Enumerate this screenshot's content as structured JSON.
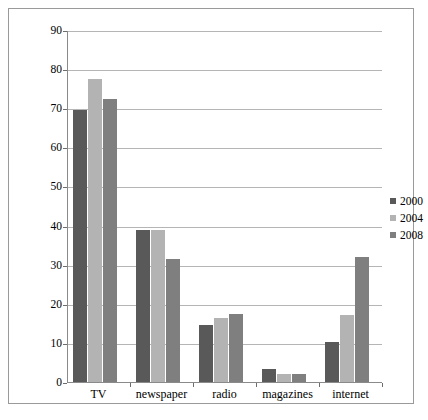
{
  "chart_data": {
    "type": "bar",
    "title": "",
    "subtitle": "",
    "xlabel": "",
    "ylabel": "% getting most of their news from…",
    "categories": [
      "TV",
      "newspaper",
      "radio",
      "magazines",
      "internet"
    ],
    "series": [
      {
        "name": "2000",
        "color": "#595959",
        "values": [
          69.7,
          39.0,
          14.8,
          3.5,
          10.5
        ]
      },
      {
        "name": "2004",
        "color": "#b3b3b3",
        "values": [
          77.8,
          39.0,
          16.6,
          2.4,
          17.5
        ]
      },
      {
        "name": "2008",
        "color": "#7f7f7f",
        "values": [
          72.6,
          31.7,
          17.7,
          2.4,
          32.2
        ]
      }
    ],
    "ylim": [
      0,
      90
    ],
    "yticks": [
      0,
      10,
      20,
      30,
      40,
      50,
      60,
      70,
      80,
      90
    ],
    "ytick_labels": [
      "0",
      "10",
      "20",
      "30",
      "40",
      "50",
      "60",
      "70",
      "80",
      "90"
    ],
    "grid": true,
    "grid_axis": "y",
    "legend_position": "right",
    "frame": true
  },
  "legend": {
    "entries": [
      {
        "label": "2000",
        "color": "#595959"
      },
      {
        "label": "2004",
        "color": "#b3b3b3"
      },
      {
        "label": "2008",
        "color": "#7f7f7f"
      }
    ]
  },
  "axis": {
    "y_title": "% getting most of their news from…"
  }
}
